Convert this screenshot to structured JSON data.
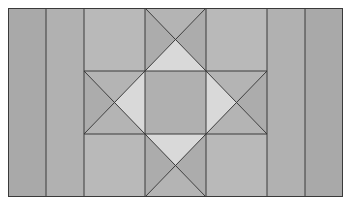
{
  "diagram": {
    "type": "quilt-star-block",
    "frame": {
      "x": 8,
      "y": 8,
      "width": 335,
      "height": 189
    },
    "columns": {
      "outer_left": {
        "x": 8,
        "width": 38,
        "fill": "#a9a9a9"
      },
      "inner_left": {
        "x": 46,
        "width": 38,
        "fill": "#b1b1b1"
      },
      "inner_right": {
        "x": 267,
        "width": 38,
        "fill": "#b1b1b1"
      },
      "outer_right": {
        "x": 305,
        "width": 38,
        "fill": "#a9a9a9"
      }
    },
    "grid": {
      "x_lines": [
        84,
        145,
        206,
        267
      ],
      "y_lines": [
        8,
        71,
        134,
        197
      ]
    },
    "colors": {
      "corner": "#b9b9b9",
      "center": "#b0b0b0",
      "star_point_light": "#d9d9d9",
      "star_point_dark": "#acacac",
      "line": "#3a3a3a"
    }
  }
}
